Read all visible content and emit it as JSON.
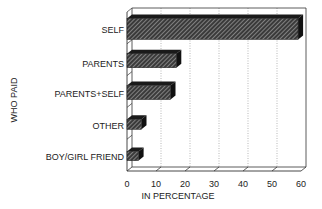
{
  "chart_data": {
    "type": "bar",
    "orientation": "horizontal",
    "style": "3d-hatched",
    "title": "",
    "xlabel": "IN PERCENTAGE",
    "ylabel": "WHO PAID",
    "categories": [
      "SELF",
      "PARENTS",
      "PARENTS+SELF",
      "OTHER",
      "BOY/GIRL FRIEND"
    ],
    "values": [
      59,
      17,
      15,
      5,
      4
    ],
    "xlim": [
      0,
      60
    ],
    "xticks": [
      "0",
      "10",
      "20",
      "30",
      "40",
      "50",
      "60"
    ],
    "grid": "vertical dotted",
    "legend": null
  },
  "colors": {
    "bar_face": "#3a3a3a",
    "bar_top": "#1a1a1a",
    "bar_side": "#111111",
    "hatch": "#bdbdbd",
    "axis": "#333333",
    "grid": "#888888"
  }
}
